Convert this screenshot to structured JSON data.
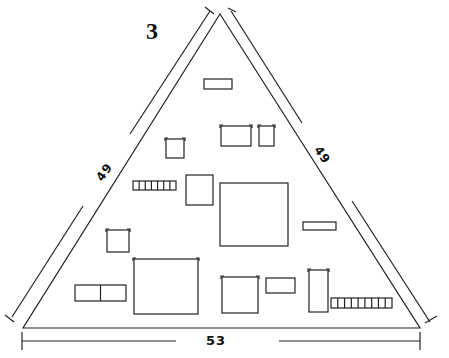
{
  "figure": {
    "label": "3",
    "shape": "triangle",
    "stroke_color": "#222222",
    "background": "#ffffff"
  },
  "dimensions": {
    "left_side": "49",
    "right_side": "49",
    "base": "53"
  },
  "components": [
    {
      "id": "top-bar",
      "type": "rect",
      "x": 204,
      "y": 79,
      "w": 28,
      "h": 10
    },
    {
      "id": "small-cap-left",
      "type": "cap",
      "x": 166,
      "y": 139,
      "w": 18,
      "h": 19
    },
    {
      "id": "cap-wide-top",
      "type": "cap",
      "x": 221,
      "y": 126,
      "w": 30,
      "h": 20
    },
    {
      "id": "cap-small-top",
      "type": "cap",
      "x": 259,
      "y": 126,
      "w": 15,
      "h": 20
    },
    {
      "id": "resistor-array-left",
      "type": "array",
      "x": 133,
      "y": 181,
      "w": 43,
      "h": 9,
      "cells": 7
    },
    {
      "id": "square-mid",
      "type": "rect",
      "x": 186,
      "y": 175,
      "w": 27,
      "h": 30
    },
    {
      "id": "big-chip",
      "type": "rect",
      "x": 220,
      "y": 183,
      "w": 68,
      "h": 63
    },
    {
      "id": "bar-right",
      "type": "rect",
      "x": 303,
      "y": 222,
      "w": 33,
      "h": 8
    },
    {
      "id": "cap-left-mid",
      "type": "cap",
      "x": 107,
      "y": 230,
      "w": 22,
      "h": 22
    },
    {
      "id": "big-box-bottom",
      "type": "cap",
      "x": 134,
      "y": 259,
      "w": 64,
      "h": 55
    },
    {
      "id": "double-rect",
      "type": "split",
      "x": 75,
      "y": 285,
      "w": 51,
      "h": 16
    },
    {
      "id": "cap-bottom-mid",
      "type": "cap",
      "x": 222,
      "y": 277,
      "w": 36,
      "h": 36
    },
    {
      "id": "rect-bottom-mid",
      "type": "rect",
      "x": 266,
      "y": 278,
      "w": 29,
      "h": 15
    },
    {
      "id": "tall-cap",
      "type": "cap",
      "x": 309,
      "y": 270,
      "w": 19,
      "h": 42
    },
    {
      "id": "resistor-array-right",
      "type": "array",
      "x": 331,
      "y": 298,
      "w": 61,
      "h": 10,
      "cells": 9
    }
  ]
}
